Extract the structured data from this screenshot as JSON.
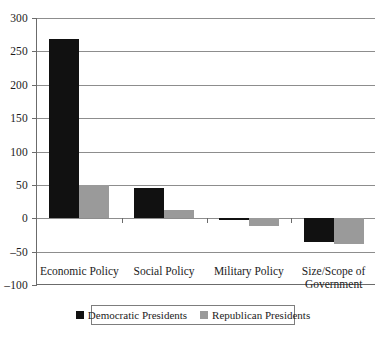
{
  "chart_data": {
    "type": "bar",
    "title": "",
    "xlabel": "",
    "ylabel": "",
    "ylim": [
      -100,
      300
    ],
    "ytick_step": 50,
    "yticks": [
      300,
      250,
      200,
      150,
      100,
      50,
      0,
      -50,
      -100
    ],
    "ytick_labels": [
      "300",
      "250",
      "200",
      "150",
      "100",
      "50",
      "0",
      "–50",
      "–100"
    ],
    "grid": true,
    "legend_position": "bottom",
    "categories": [
      "Economic Policy",
      "Social Policy",
      "Military Policy",
      "Size/Scope of\nGovernment"
    ],
    "series": [
      {
        "name": "Democratic Presidents",
        "color": "#111111",
        "values": [
          268,
          45,
          -3,
          -36
        ]
      },
      {
        "name": "Republican Presidents",
        "color": "#9a9a9a",
        "values": [
          50,
          13,
          -12,
          -38
        ]
      }
    ]
  },
  "legend": {
    "items": [
      {
        "label": "Democratic Presidents",
        "swatch": "dem"
      },
      {
        "label": "Republican Presidents",
        "swatch": "rep"
      }
    ]
  },
  "colors": {
    "democratic": "#111111",
    "republican": "#9a9a9a",
    "gridline": "#8d8d8d",
    "axis": "#6b6b6b",
    "background": "#ffffff"
  }
}
